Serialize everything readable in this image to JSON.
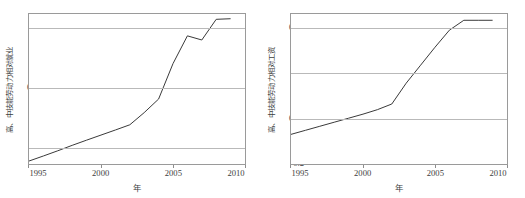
{
  "figure": {
    "background_color": "#ffffff",
    "line_color": "#3a3a3a",
    "grid_color": "#b9b9b9",
    "frame_color": "#9a9a9a"
  },
  "chart_data": [
    {
      "type": "line",
      "title": "",
      "xlabel": "年",
      "ylabel": "高、中技能劳动力相对就业",
      "xlim": [
        1995,
        2010
      ],
      "ylim": [
        0.085,
        0.212
      ],
      "xticks": [
        1995,
        2000,
        2005,
        2010
      ],
      "xticklabels": [
        "1995",
        "2000",
        "2005",
        "2010"
      ],
      "yticks": [
        0.1,
        0.15,
        0.2
      ],
      "yticklabels": [
        "0.1",
        "0.15",
        "0.2"
      ],
      "grid": true,
      "legend": "none",
      "x": [
        1995,
        1996,
        1997,
        1998,
        1999,
        2000,
        2001,
        2002,
        2003,
        2004,
        2005,
        2006,
        2007,
        2008,
        2009
      ],
      "values": [
        0.0875,
        0.0918,
        0.0962,
        0.1008,
        0.1052,
        0.1095,
        0.1138,
        0.1182,
        0.1285,
        0.14,
        0.17,
        0.1935,
        0.19,
        0.2075,
        0.208
      ]
    },
    {
      "type": "line",
      "title": "",
      "xlabel": "年",
      "ylabel": "高、中技能劳动力相对工资",
      "xlim": [
        1995,
        2010
      ],
      "ylim": [
        0.198,
        0.365
      ],
      "xticks": [
        1995,
        2000,
        2005,
        2010
      ],
      "xticklabels": [
        "1995",
        "2000",
        "2005",
        "2010"
      ],
      "yticks": [
        0.2,
        0.25,
        0.3,
        0.35
      ],
      "yticklabels": [
        "0.2",
        "0.25",
        "0.3",
        "0.35"
      ],
      "grid": true,
      "legend": "none",
      "x": [
        1995,
        1996,
        1997,
        1998,
        1999,
        2000,
        2001,
        2002,
        2003,
        2004,
        2005,
        2006,
        2007,
        2008,
        2009
      ],
      "values": [
        0.231,
        0.2355,
        0.24,
        0.2445,
        0.249,
        0.2535,
        0.2585,
        0.2648,
        0.288,
        0.308,
        0.328,
        0.347,
        0.358,
        0.358,
        0.358
      ]
    }
  ]
}
